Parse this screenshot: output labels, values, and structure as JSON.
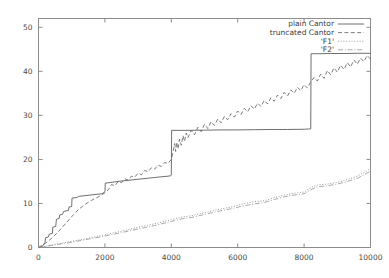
{
  "chart_data": {
    "type": "line",
    "title": "",
    "xlabel": "",
    "ylabel": "",
    "xlim": [
      0,
      10000
    ],
    "ylim": [
      0,
      52
    ],
    "grid": false,
    "legend_position": "top-right",
    "xticks": [
      0,
      2000,
      4000,
      6000,
      8000,
      10000
    ],
    "xtick_labels": [
      "0",
      "2000",
      "4000",
      "6000",
      "8000",
      "10000"
    ],
    "yticks": [
      0,
      10,
      20,
      30,
      40,
      50
    ],
    "ytick_labels": [
      "0",
      "10",
      "20",
      "30",
      "40",
      "50"
    ],
    "colors": {
      "axis": "#8c8c8c",
      "text": "#3d3d3d",
      "plain_cantor": "#555555",
      "truncated_cantor": "#666666",
      "f1": "#888888",
      "f2": "#999999"
    },
    "series": [
      {
        "name": "plain Cantor",
        "style": "solid",
        "note": "monotone step / devil's-staircase: flat plateaus with sharp vertical jumps",
        "points": [
          [
            0,
            0
          ],
          [
            120,
            0.3
          ],
          [
            200,
            1.2
          ],
          [
            210,
            2.2
          ],
          [
            300,
            2.4
          ],
          [
            320,
            3.0
          ],
          [
            420,
            3.2
          ],
          [
            430,
            4.6
          ],
          [
            520,
            4.8
          ],
          [
            540,
            6.4
          ],
          [
            620,
            6.6
          ],
          [
            640,
            7.4
          ],
          [
            720,
            7.5
          ],
          [
            760,
            8.2
          ],
          [
            900,
            8.4
          ],
          [
            920,
            9.2
          ],
          [
            1000,
            9.3
          ],
          [
            1010,
            11.2
          ],
          [
            1180,
            11.4
          ],
          [
            1200,
            11.6
          ],
          [
            1900,
            12.2
          ],
          [
            1960,
            12.4
          ],
          [
            1980,
            12.6
          ],
          [
            2000,
            12.7
          ],
          [
            2005,
            13.0
          ],
          [
            2010,
            14.6
          ],
          [
            2100,
            14.7
          ],
          [
            2500,
            15.1
          ],
          [
            3000,
            15.5
          ],
          [
            3500,
            15.9
          ],
          [
            3900,
            16.2
          ],
          [
            3980,
            16.3
          ],
          [
            4000,
            16.4
          ],
          [
            4010,
            26.6
          ],
          [
            4500,
            26.6
          ],
          [
            5000,
            26.65
          ],
          [
            5500,
            26.7
          ],
          [
            6000,
            26.7
          ],
          [
            6500,
            26.75
          ],
          [
            7000,
            26.8
          ],
          [
            7500,
            26.8
          ],
          [
            8000,
            26.85
          ],
          [
            8100,
            26.9
          ],
          [
            8150,
            26.9
          ],
          [
            8200,
            26.95
          ],
          [
            8210,
            44.0
          ],
          [
            8400,
            44.0
          ],
          [
            8800,
            44.05
          ],
          [
            9200,
            44.05
          ],
          [
            9600,
            44.1
          ],
          [
            10000,
            44.1
          ]
        ]
      },
      {
        "name": "truncated Cantor",
        "style": "dashed",
        "note": "noisy jagged trace tracking below the plain Cantor staircase",
        "points": [
          [
            0,
            0
          ],
          [
            200,
            0.9
          ],
          [
            400,
            2.1
          ],
          [
            600,
            3.6
          ],
          [
            800,
            5.3
          ],
          [
            1000,
            7.0
          ],
          [
            1200,
            8.6
          ],
          [
            1400,
            9.8
          ],
          [
            1600,
            10.7
          ],
          [
            1800,
            11.5
          ],
          [
            2000,
            12.4
          ],
          [
            2100,
            13.1
          ],
          [
            2200,
            14.3
          ],
          [
            2300,
            14.0
          ],
          [
            2400,
            15.0
          ],
          [
            2500,
            14.7
          ],
          [
            2600,
            15.6
          ],
          [
            2700,
            15.3
          ],
          [
            2800,
            16.2
          ],
          [
            2900,
            16.0
          ],
          [
            3000,
            16.9
          ],
          [
            3100,
            16.5
          ],
          [
            3200,
            17.5
          ],
          [
            3300,
            17.2
          ],
          [
            3400,
            18.1
          ],
          [
            3500,
            17.8
          ],
          [
            3600,
            18.7
          ],
          [
            3700,
            18.4
          ],
          [
            3800,
            19.3
          ],
          [
            3900,
            19.1
          ],
          [
            4000,
            20.0
          ],
          [
            4050,
            21.6
          ],
          [
            4100,
            23.6
          ],
          [
            4130,
            21.8
          ],
          [
            4160,
            23.9
          ],
          [
            4200,
            22.4
          ],
          [
            4250,
            24.6
          ],
          [
            4300,
            23.2
          ],
          [
            4350,
            25.4
          ],
          [
            4400,
            24.1
          ],
          [
            4450,
            26.0
          ],
          [
            4500,
            24.9
          ],
          [
            4600,
            26.6
          ],
          [
            4700,
            25.6
          ],
          [
            4800,
            27.3
          ],
          [
            4900,
            26.3
          ],
          [
            5000,
            28.0
          ],
          [
            5100,
            27.0
          ],
          [
            5200,
            28.6
          ],
          [
            5300,
            27.7
          ],
          [
            5400,
            29.2
          ],
          [
            5500,
            28.3
          ],
          [
            5600,
            29.8
          ],
          [
            5700,
            29.0
          ],
          [
            5800,
            30.4
          ],
          [
            5900,
            29.6
          ],
          [
            6000,
            31.0
          ],
          [
            6100,
            30.2
          ],
          [
            6200,
            31.6
          ],
          [
            6300,
            30.8
          ],
          [
            6400,
            32.2
          ],
          [
            6500,
            31.4
          ],
          [
            6600,
            32.8
          ],
          [
            6700,
            32.0
          ],
          [
            6800,
            33.4
          ],
          [
            6900,
            32.6
          ],
          [
            7000,
            34.0
          ],
          [
            7100,
            33.2
          ],
          [
            7200,
            34.6
          ],
          [
            7300,
            33.8
          ],
          [
            7400,
            35.2
          ],
          [
            7500,
            34.4
          ],
          [
            7600,
            35.8
          ],
          [
            7700,
            35.0
          ],
          [
            7800,
            36.4
          ],
          [
            7900,
            35.6
          ],
          [
            8000,
            37.0
          ],
          [
            8100,
            36.2
          ],
          [
            8200,
            37.6
          ],
          [
            8300,
            38.6
          ],
          [
            8400,
            37.8
          ],
          [
            8500,
            39.4
          ],
          [
            8600,
            38.4
          ],
          [
            8700,
            40.2
          ],
          [
            8800,
            39.2
          ],
          [
            8900,
            40.8
          ],
          [
            9000,
            39.8
          ],
          [
            9100,
            41.4
          ],
          [
            9200,
            40.4
          ],
          [
            9300,
            42.0
          ],
          [
            9400,
            41.0
          ],
          [
            9500,
            42.6
          ],
          [
            9600,
            41.6
          ],
          [
            9700,
            43.0
          ],
          [
            9800,
            42.2
          ],
          [
            9900,
            43.6
          ],
          [
            10000,
            42.8
          ]
        ]
      },
      {
        "name": "'F1'",
        "style": "dotted",
        "note": "slowly rising staircase reaching about 18 at x=10000",
        "points": [
          [
            0,
            0
          ],
          [
            500,
            0.7
          ],
          [
            1000,
            1.4
          ],
          [
            1500,
            2.1
          ],
          [
            2000,
            2.9
          ],
          [
            2500,
            3.7
          ],
          [
            3000,
            4.6
          ],
          [
            3500,
            5.4
          ],
          [
            4000,
            6.3
          ],
          [
            4300,
            6.9
          ],
          [
            4600,
            7.2
          ],
          [
            5000,
            7.9
          ],
          [
            5400,
            8.6
          ],
          [
            5800,
            9.2
          ],
          [
            6200,
            10.0
          ],
          [
            6500,
            10.4
          ],
          [
            6800,
            10.6
          ],
          [
            7100,
            11.3
          ],
          [
            7400,
            11.9
          ],
          [
            7700,
            12.3
          ],
          [
            8000,
            12.6
          ],
          [
            8200,
            13.6
          ],
          [
            8400,
            14.2
          ],
          [
            8700,
            14.4
          ],
          [
            9000,
            14.8
          ],
          [
            9300,
            15.4
          ],
          [
            9600,
            16.2
          ],
          [
            9800,
            17.0
          ],
          [
            10000,
            17.9
          ]
        ]
      },
      {
        "name": "'F2'",
        "style": "dashdot",
        "note": "nearly coincident with F1, slightly lower through the middle",
        "points": [
          [
            0,
            0
          ],
          [
            500,
            0.6
          ],
          [
            1000,
            1.2
          ],
          [
            1500,
            1.9
          ],
          [
            2000,
            2.6
          ],
          [
            2500,
            3.4
          ],
          [
            3000,
            4.2
          ],
          [
            3500,
            5.0
          ],
          [
            4000,
            5.9
          ],
          [
            4300,
            6.5
          ],
          [
            4600,
            6.8
          ],
          [
            5000,
            7.5
          ],
          [
            5400,
            8.2
          ],
          [
            5800,
            8.8
          ],
          [
            6200,
            9.5
          ],
          [
            6500,
            9.9
          ],
          [
            6800,
            10.2
          ],
          [
            7100,
            10.9
          ],
          [
            7400,
            11.5
          ],
          [
            7700,
            11.9
          ],
          [
            8000,
            12.2
          ],
          [
            8200,
            13.1
          ],
          [
            8400,
            13.8
          ],
          [
            8700,
            14.0
          ],
          [
            9000,
            14.4
          ],
          [
            9300,
            15.0
          ],
          [
            9600,
            15.7
          ],
          [
            9800,
            16.5
          ],
          [
            10000,
            17.3
          ]
        ]
      }
    ],
    "legend": [
      {
        "label": "plain Cantor",
        "style": "solid"
      },
      {
        "label": "truncated Cantor",
        "style": "dashed"
      },
      {
        "label": "'F1'",
        "style": "dotted"
      },
      {
        "label": "'F2'",
        "style": "dashdot"
      }
    ]
  }
}
